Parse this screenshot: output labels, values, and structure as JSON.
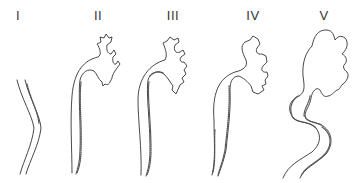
{
  "figure": {
    "stages": [
      {
        "label": "I",
        "x": 18
      },
      {
        "label": "II",
        "x": 98
      },
      {
        "label": "III",
        "x": 173
      },
      {
        "label": "IV",
        "x": 253
      },
      {
        "label": "V",
        "x": 324
      }
    ],
    "colors": {
      "line": "#333333",
      "background": "#ffffff"
    }
  }
}
